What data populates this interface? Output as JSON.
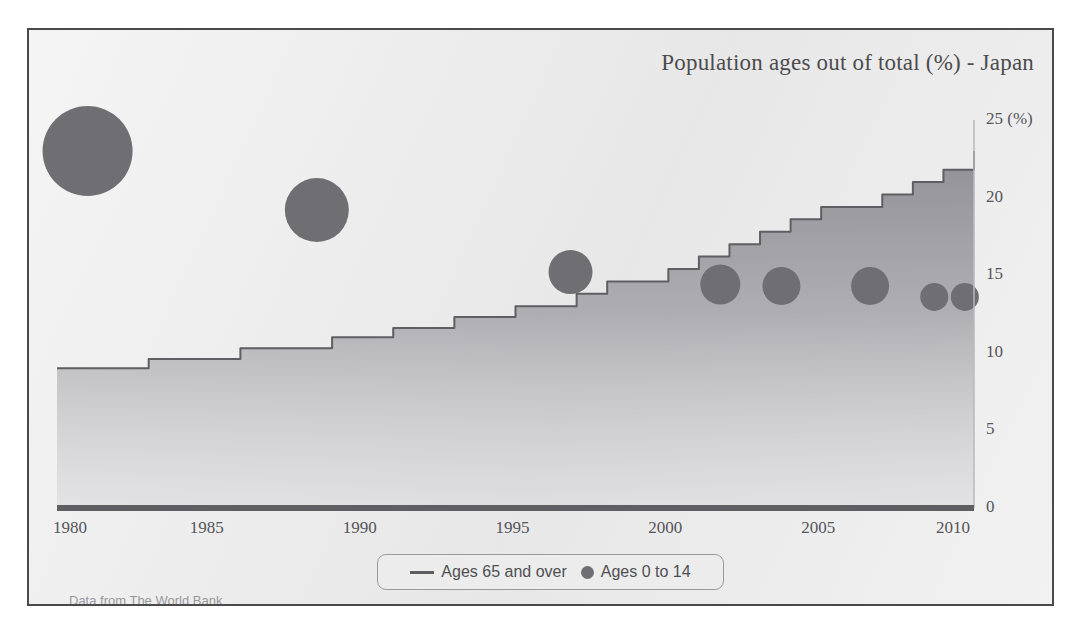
{
  "chart_data": {
    "type": "area",
    "title": "Population ages out of total (%) - Japan",
    "xlabel": "",
    "ylabel": "",
    "yaxis_unit": "(%)",
    "xlim": [
      1980,
      2010
    ],
    "ylim": [
      0,
      25
    ],
    "grid": false,
    "legend_position": "bottom-center",
    "source_note": "Data from The World Bank",
    "y_ticks": [
      "0",
      "5",
      "10",
      "15",
      "20",
      "25 (%)"
    ],
    "y_tick_values": [
      0,
      5,
      10,
      15,
      20,
      25
    ],
    "x_ticks": [
      "1980",
      "1985",
      "1990",
      "1995",
      "2000",
      "2005",
      "2010"
    ],
    "x_tick_values": [
      1980,
      1985,
      1990,
      1995,
      2000,
      2005,
      2010
    ],
    "series": [
      {
        "name": "Ages 65 and over",
        "type": "area-step",
        "color": "#8a8a8f",
        "x": [
          1980,
          1981,
          1982,
          1983,
          1984,
          1985,
          1986,
          1987,
          1988,
          1989,
          1990,
          1991,
          1992,
          1993,
          1994,
          1995,
          1996,
          1997,
          1998,
          1999,
          2000,
          2001,
          2002,
          2003,
          2004,
          2005,
          2006,
          2007,
          2008,
          2009,
          2010
        ],
        "values": [
          9.0,
          9.0,
          9.0,
          9.6,
          9.6,
          9.6,
          10.3,
          10.3,
          10.3,
          11.0,
          11.0,
          11.6,
          11.6,
          12.3,
          12.3,
          13.0,
          13.0,
          13.8,
          14.6,
          14.6,
          15.4,
          16.2,
          17.0,
          17.8,
          18.6,
          19.4,
          19.4,
          20.2,
          21.0,
          21.8,
          23.0
        ]
      },
      {
        "name": "Ages 0 to 14",
        "type": "bubble",
        "color": "#6e6e73",
        "points": [
          {
            "x": 1981.0,
            "y": 23.0,
            "size": 45
          },
          {
            "x": 1988.5,
            "y": 19.2,
            "size": 32
          },
          {
            "x": 1996.8,
            "y": 15.2,
            "size": 22
          },
          {
            "x": 2001.7,
            "y": 14.4,
            "size": 20
          },
          {
            "x": 2003.7,
            "y": 14.3,
            "size": 19
          },
          {
            "x": 2006.6,
            "y": 14.3,
            "size": 19
          },
          {
            "x": 2008.7,
            "y": 13.6,
            "size": 14
          },
          {
            "x": 2009.7,
            "y": 13.6,
            "size": 14
          }
        ]
      }
    ]
  },
  "legend": {
    "entries": [
      {
        "label": "Ages 65 and over",
        "marker": "line-swatch"
      },
      {
        "label": "Ages 0 to 14",
        "marker": "dot-swatch"
      }
    ]
  },
  "icons": {
    "line_swatch": "line-swatch-icon",
    "dot_swatch": "dot-swatch-icon"
  }
}
